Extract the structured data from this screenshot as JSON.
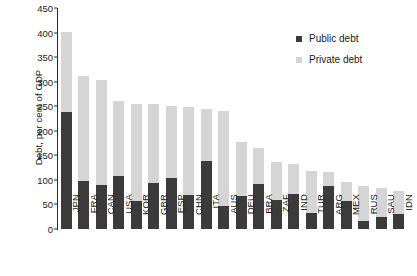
{
  "chart_data": {
    "type": "bar",
    "stacked": true,
    "title": "",
    "xlabel": "",
    "ylabel": "Debt, per cent of GDP",
    "ylim": [
      0,
      450
    ],
    "ytick_step": 50,
    "yticks": [
      0,
      50,
      100,
      150,
      200,
      250,
      300,
      350,
      400,
      450
    ],
    "grid": false,
    "legend_position": "top-right",
    "categories": [
      "JPN",
      "FRA",
      "CAN",
      "USA",
      "KOR",
      "GBR",
      "ESP",
      "CHN",
      "ITA",
      "AUS",
      "DEU",
      "BRA",
      "ZAF",
      "IND",
      "TUR",
      "ARG",
      "MEX",
      "RUS",
      "SAU",
      "IDN"
    ],
    "series": [
      {
        "name": "Public debt",
        "color": "#3b3b3b",
        "values": [
          238,
          98,
          89,
          108,
          58,
          94,
          103,
          69,
          139,
          46,
          68,
          91,
          59,
          72,
          33,
          87,
          57,
          17,
          24,
          30
        ]
      },
      {
        "name": "Private debt",
        "color": "#d5d5d5",
        "values": [
          163,
          214,
          214,
          153,
          196,
          160,
          147,
          179,
          106,
          195,
          110,
          74,
          78,
          61,
          86,
          29,
          38,
          71,
          60,
          47
        ]
      }
    ],
    "totals": [
      401,
      312,
      303,
      261,
      254,
      254,
      250,
      248,
      245,
      241,
      178,
      165,
      137,
      133,
      119,
      116,
      95,
      88,
      84,
      77
    ]
  },
  "legend": {
    "items": [
      {
        "label": "Public debt",
        "swatch": "public"
      },
      {
        "label": "Private debt",
        "swatch": "private"
      }
    ]
  }
}
